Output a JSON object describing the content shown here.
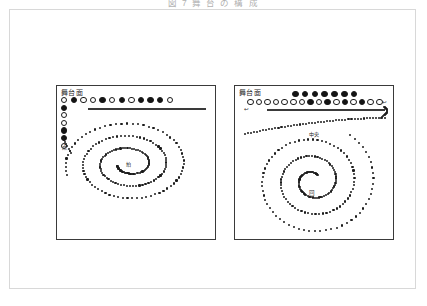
{
  "figure": {
    "caption": "図 7  舞 台 の 構 成",
    "background_color": "#ffffff",
    "frame_border_color": "#d8d8d8",
    "ink_color": "#1a1a1a"
  },
  "panels": [
    {
      "id": "left",
      "name": "panel-left",
      "stage_label": "舞台面",
      "center_label": "拍",
      "column_label": "点",
      "rule_label": "",
      "top_row": {
        "name": "performer-row-main",
        "count": 12,
        "pattern": [
          "open",
          "filled",
          "open",
          "open",
          "filled",
          "open",
          "filled",
          "open",
          "filled",
          "filled",
          "filled",
          "open"
        ]
      },
      "side_column": {
        "name": "performer-column",
        "count": 6,
        "pattern": [
          "filled",
          "open",
          "open",
          "filled",
          "filled",
          "open"
        ]
      },
      "spiral": {
        "name": "spiral-path-elliptical",
        "type": "ellipse-spiral",
        "turns": 3,
        "dot_count": 200,
        "direction": "inward-clockwise",
        "center_x": 72,
        "center_y": 78,
        "rx_outer": 64,
        "ry_outer": 44,
        "rx_inner": 12,
        "ry_inner": 7
      },
      "annotations": []
    },
    {
      "id": "right",
      "name": "panel-right",
      "stage_label": "舞台面",
      "center_label": "",
      "column_label": "",
      "rule_label": "",
      "upper_row": {
        "name": "performer-row-upper",
        "count": 7,
        "pattern": [
          "filled",
          "filled",
          "filled",
          "filled",
          "filled",
          "filled",
          "filled"
        ]
      },
      "lower_row": {
        "name": "performer-row-lower",
        "count": 16,
        "pattern": [
          "open",
          "open",
          "open",
          "open",
          "open",
          "open",
          "open",
          "filled",
          "open",
          "filled",
          "open",
          "filled",
          "open",
          "filled",
          "open",
          "open"
        ]
      },
      "spiral": {
        "name": "spiral-path-round",
        "type": "round-spiral",
        "turns": 3,
        "dot_count": 190,
        "direction": "inward-clockwise",
        "center_x": 78,
        "center_y": 95,
        "r_outer": 62,
        "r_inner": 8
      },
      "annotations": [
        {
          "name": "annotation-entry-arrow",
          "text": "↩",
          "x": 147,
          "y": 13
        },
        {
          "name": "annotation-lead-in",
          "text": "↩",
          "x": 9,
          "y": 20
        },
        {
          "name": "annotation-mid-path",
          "text": "中央",
          "x": 73,
          "y": 45
        },
        {
          "name": "annotation-lower-path",
          "text": "回",
          "x": 74,
          "y": 104
        }
      ]
    }
  ]
}
